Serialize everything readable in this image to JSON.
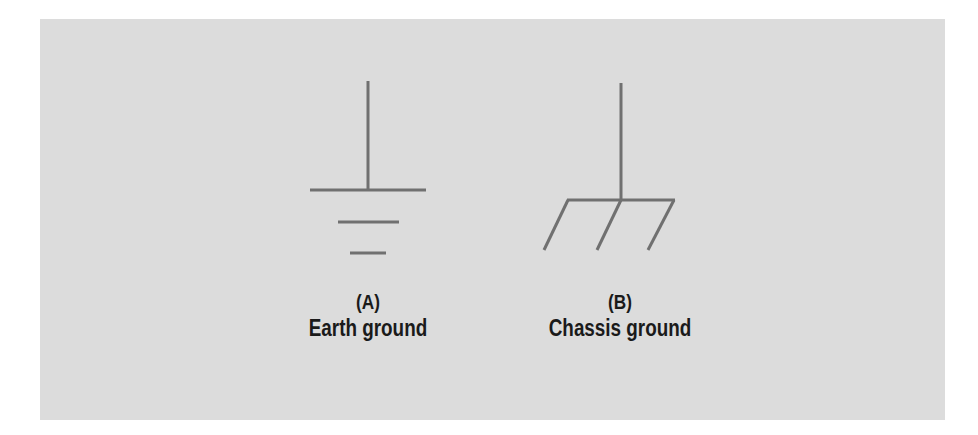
{
  "diagram": {
    "background_color": "#dcdcdc",
    "stroke_color": "#707070",
    "symbols": [
      {
        "id": "A",
        "icon": "earth-ground-icon",
        "letter": "(A)",
        "name": "Earth ground"
      },
      {
        "id": "B",
        "icon": "chassis-ground-icon",
        "letter": "(B)",
        "name": "Chassis ground"
      }
    ]
  }
}
